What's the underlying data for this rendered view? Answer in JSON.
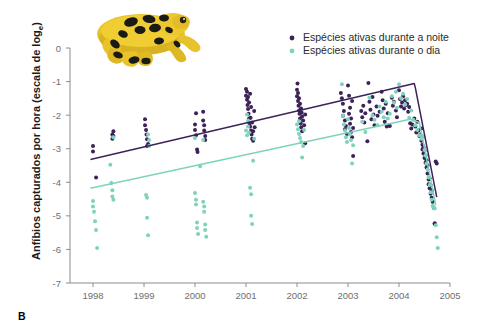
{
  "panel": {
    "letter": "B"
  },
  "axes": {
    "ylabel": "Anfíbios capturados por hora (escala de log",
    "ylabel_sub": "e",
    "ylabel_close": ")",
    "yticks": [
      "0",
      "-1",
      "-2",
      "-3",
      "-4",
      "-5",
      "-6",
      "-7"
    ],
    "xticks": [
      "1998",
      "1999",
      "2000",
      "2001",
      "2002",
      "2003",
      "2004",
      "2005"
    ]
  },
  "legend": {
    "items": [
      {
        "label": "Espécies ativas durante a noite",
        "color": "#3c2259",
        "key": "night"
      },
      {
        "label": "Espécies ativas durante o dia",
        "color": "#7fd3bb",
        "key": "day"
      }
    ]
  },
  "illustration": {
    "name": "harlequin-frog",
    "body_color": "#e8c32a",
    "spot_color": "#1c1a14",
    "shadow_color": "#b08c16"
  },
  "chart_data": {
    "type": "scatter",
    "title": "",
    "xlabel": "",
    "ylabel": "Anfíbios capturados por hora (escala de log_e)",
    "xlim": [
      1997.6,
      2005.3
    ],
    "ylim": [
      -7,
      0
    ],
    "grid": false,
    "legend_position": "top-right",
    "series": [
      {
        "name": "Espécies ativas durante a noite",
        "color": "#3c2259",
        "marker": "circle",
        "points": [
          [
            1998.0,
            -2.92
          ],
          [
            1998.0,
            -3.08
          ],
          [
            1998.06,
            -3.86
          ],
          [
            1998.38,
            -2.58
          ],
          [
            1998.38,
            -2.7
          ],
          [
            1998.4,
            -2.48
          ],
          [
            1998.4,
            -2.62
          ],
          [
            1999.02,
            -2.12
          ],
          [
            1999.02,
            -2.3
          ],
          [
            1999.04,
            -2.44
          ],
          [
            1999.05,
            -2.58
          ],
          [
            1999.06,
            -2.72
          ],
          [
            1999.06,
            -2.92
          ],
          [
            1999.08,
            -2.86
          ],
          [
            2000.0,
            -2.28
          ],
          [
            2000.0,
            -2.44
          ],
          [
            2000.02,
            -2.6
          ],
          [
            2000.02,
            -1.94
          ],
          [
            2000.04,
            -3.02
          ],
          [
            2000.05,
            -3.1
          ],
          [
            2000.16,
            -1.9
          ],
          [
            2000.16,
            -2.16
          ],
          [
            2000.18,
            -2.3
          ],
          [
            2000.18,
            -2.46
          ],
          [
            2000.2,
            -2.62
          ],
          [
            2000.2,
            -2.74
          ],
          [
            2001.0,
            -1.22
          ],
          [
            2001.0,
            -1.42
          ],
          [
            2001.02,
            -1.3
          ],
          [
            2001.02,
            -1.54
          ],
          [
            2001.03,
            -1.7
          ],
          [
            2001.04,
            -1.82
          ],
          [
            2001.04,
            -1.46
          ],
          [
            2001.05,
            -1.96
          ],
          [
            2001.06,
            -2.1
          ],
          [
            2001.06,
            -1.62
          ],
          [
            2001.07,
            -2.24
          ],
          [
            2001.08,
            -2.34
          ],
          [
            2001.08,
            -1.36
          ],
          [
            2001.09,
            -2.08
          ],
          [
            2001.1,
            -2.46
          ],
          [
            2001.1,
            -1.76
          ],
          [
            2001.11,
            -2.58
          ],
          [
            2001.12,
            -2.7
          ],
          [
            2001.12,
            -2.22
          ],
          [
            2001.14,
            -2.48
          ],
          [
            2001.14,
            -2.76
          ],
          [
            2001.16,
            -1.88
          ],
          [
            2001.17,
            -2.36
          ],
          [
            2002.0,
            -1.24
          ],
          [
            2002.0,
            -1.44
          ],
          [
            2002.01,
            -1.06
          ],
          [
            2002.02,
            -1.58
          ],
          [
            2002.02,
            -1.34
          ],
          [
            2002.03,
            -1.72
          ],
          [
            2002.04,
            -1.86
          ],
          [
            2002.04,
            -1.5
          ],
          [
            2002.05,
            -1.96
          ],
          [
            2002.06,
            -2.1
          ],
          [
            2002.06,
            -1.66
          ],
          [
            2002.07,
            -2.24
          ],
          [
            2002.08,
            -1.8
          ],
          [
            2002.08,
            -2.36
          ],
          [
            2002.09,
            -1.92
          ],
          [
            2002.1,
            -2.04
          ],
          [
            2002.1,
            -2.48
          ],
          [
            2002.12,
            -2.16
          ],
          [
            2002.14,
            -2.3
          ],
          [
            2002.16,
            -2.84
          ],
          [
            2002.16,
            -1.98
          ],
          [
            2002.86,
            -1.34
          ],
          [
            2002.88,
            -1.5
          ],
          [
            2002.9,
            -1.66
          ],
          [
            2002.9,
            -2.02
          ],
          [
            2002.92,
            -1.88
          ],
          [
            2002.94,
            -2.16
          ],
          [
            2002.94,
            -2.42
          ],
          [
            2002.96,
            -2.32
          ],
          [
            2002.98,
            -2.56
          ],
          [
            2003.0,
            -1.12
          ],
          [
            2003.02,
            -1.42
          ],
          [
            2003.02,
            -1.96
          ],
          [
            2003.04,
            -1.78
          ],
          [
            2003.04,
            -2.26
          ],
          [
            2003.06,
            -2.1
          ],
          [
            2003.06,
            -2.5
          ],
          [
            2003.08,
            -2.66
          ],
          [
            2003.08,
            -1.58
          ],
          [
            2003.1,
            -2.38
          ],
          [
            2003.1,
            -3.22
          ],
          [
            2003.26,
            -1.88
          ],
          [
            2003.28,
            -2.06
          ],
          [
            2003.3,
            -1.72
          ],
          [
            2003.32,
            -2.22
          ],
          [
            2003.34,
            -1.94
          ],
          [
            2003.38,
            -2.78
          ],
          [
            2003.4,
            -1.04
          ],
          [
            2003.42,
            -1.6
          ],
          [
            2003.44,
            -1.84
          ],
          [
            2003.46,
            -2.12
          ],
          [
            2003.48,
            -1.46
          ],
          [
            2003.5,
            -1.98
          ],
          [
            2003.52,
            -2.3
          ],
          [
            2003.56,
            -1.74
          ],
          [
            2003.58,
            -2.02
          ],
          [
            2003.62,
            -1.9
          ],
          [
            2003.66,
            -1.3
          ],
          [
            2003.68,
            -1.56
          ],
          [
            2003.7,
            -1.8
          ],
          [
            2003.72,
            -2.2
          ],
          [
            2003.74,
            -1.66
          ],
          [
            2003.76,
            -2.34
          ],
          [
            2003.78,
            -1.94
          ],
          [
            2003.8,
            -2.3
          ],
          [
            2003.82,
            -2.32
          ],
          [
            2003.86,
            -1.48
          ],
          [
            2003.88,
            -1.72
          ],
          [
            2003.9,
            -1.6
          ],
          [
            2003.94,
            -1.86
          ],
          [
            2003.96,
            -2.06
          ],
          [
            2004.0,
            -1.26
          ],
          [
            2004.02,
            -1.52
          ],
          [
            2004.04,
            -1.74
          ],
          [
            2004.06,
            -1.62
          ],
          [
            2004.08,
            -1.44
          ],
          [
            2004.1,
            -1.8
          ],
          [
            2004.12,
            -1.56
          ],
          [
            2004.14,
            -1.7
          ],
          [
            2004.16,
            -1.66
          ],
          [
            2004.18,
            -1.9
          ],
          [
            2004.2,
            -1.76
          ],
          [
            2004.22,
            -2.24
          ],
          [
            2004.24,
            -2.4
          ],
          [
            2004.26,
            -2.28
          ],
          [
            2004.3,
            -2.1
          ],
          [
            2004.32,
            -2.34
          ],
          [
            2004.34,
            -2.52
          ],
          [
            2004.36,
            -2.2
          ],
          [
            2004.38,
            -2.46
          ],
          [
            2004.4,
            -2.62
          ],
          [
            2004.42,
            -2.58
          ],
          [
            2004.44,
            -2.76
          ],
          [
            2004.44,
            -2.4
          ],
          [
            2004.46,
            -2.88
          ],
          [
            2004.46,
            -3.02
          ],
          [
            2004.48,
            -3.14
          ],
          [
            2004.48,
            -2.96
          ],
          [
            2004.5,
            -3.28
          ],
          [
            2004.5,
            -3.06
          ],
          [
            2004.52,
            -3.42
          ],
          [
            2004.52,
            -3.2
          ],
          [
            2004.54,
            -3.56
          ],
          [
            2004.54,
            -3.34
          ],
          [
            2004.56,
            -3.74
          ],
          [
            2004.56,
            -3.5
          ],
          [
            2004.58,
            -3.92
          ],
          [
            2004.58,
            -4.06
          ],
          [
            2004.6,
            -4.18
          ],
          [
            2004.6,
            -3.88
          ],
          [
            2004.62,
            -4.34
          ],
          [
            2004.62,
            -4.08
          ],
          [
            2004.64,
            -4.46
          ],
          [
            2004.64,
            -4.24
          ],
          [
            2004.66,
            -4.58
          ],
          [
            2004.68,
            -4.76
          ],
          [
            2004.7,
            -5.22
          ],
          [
            2004.7,
            -5.24
          ],
          [
            2004.72,
            -3.38
          ],
          [
            2004.74,
            -3.44
          ]
        ]
      },
      {
        "name": "Espécies ativas durante o dia",
        "color": "#7fd3bb",
        "marker": "circle",
        "points": [
          [
            1998.0,
            -4.56
          ],
          [
            1998.0,
            -4.72
          ],
          [
            1998.02,
            -4.88
          ],
          [
            1998.04,
            -5.16
          ],
          [
            1998.06,
            -5.42
          ],
          [
            1998.08,
            -5.96
          ],
          [
            1998.34,
            -3.48
          ],
          [
            1998.36,
            -4.02
          ],
          [
            1998.38,
            -4.24
          ],
          [
            1998.38,
            -4.42
          ],
          [
            1998.4,
            -4.52
          ],
          [
            1998.4,
            -2.66
          ],
          [
            1999.04,
            -4.38
          ],
          [
            1999.06,
            -4.46
          ],
          [
            1999.06,
            -5.06
          ],
          [
            1999.08,
            -5.58
          ],
          [
            1999.08,
            -2.58
          ],
          [
            1999.1,
            -2.74
          ],
          [
            1999.1,
            -2.92
          ],
          [
            2000.0,
            -2.68
          ],
          [
            2000.0,
            -4.32
          ],
          [
            2000.02,
            -4.52
          ],
          [
            2000.02,
            -4.66
          ],
          [
            2000.04,
            -5.2
          ],
          [
            2000.04,
            -5.36
          ],
          [
            2000.06,
            -5.54
          ],
          [
            2000.16,
            -2.74
          ],
          [
            2000.16,
            -4.58
          ],
          [
            2000.18,
            -4.72
          ],
          [
            2000.18,
            -4.88
          ],
          [
            2000.2,
            -5.26
          ],
          [
            2000.2,
            -5.42
          ],
          [
            2000.22,
            -5.62
          ],
          [
            2000.1,
            -3.52
          ],
          [
            2001.0,
            -2.46
          ],
          [
            2001.02,
            -2.6
          ],
          [
            2001.02,
            -1.98
          ],
          [
            2001.04,
            -2.16
          ],
          [
            2001.04,
            -2.34
          ],
          [
            2001.06,
            -2.52
          ],
          [
            2001.08,
            -4.16
          ],
          [
            2001.1,
            -4.36
          ],
          [
            2001.1,
            -5.0
          ],
          [
            2001.12,
            -5.24
          ],
          [
            2001.14,
            -3.36
          ],
          [
            2001.16,
            -2.7
          ],
          [
            2002.0,
            -2.28
          ],
          [
            2002.02,
            -2.42
          ],
          [
            2002.04,
            -2.56
          ],
          [
            2002.04,
            -2.18
          ],
          [
            2002.06,
            -2.68
          ],
          [
            2002.08,
            -2.8
          ],
          [
            2002.1,
            -3.26
          ],
          [
            2002.12,
            -2.92
          ],
          [
            2002.14,
            -2.44
          ],
          [
            2002.88,
            -1.08
          ],
          [
            2002.9,
            -2.02
          ],
          [
            2002.92,
            -2.28
          ],
          [
            2002.94,
            -2.46
          ],
          [
            2002.96,
            -2.66
          ],
          [
            2002.98,
            -2.8
          ],
          [
            2003.0,
            -2.12
          ],
          [
            2003.02,
            -2.38
          ],
          [
            2003.04,
            -2.58
          ],
          [
            2003.06,
            -2.74
          ],
          [
            2003.08,
            -3.44
          ],
          [
            2003.1,
            -2.9
          ],
          [
            2003.28,
            -2.2
          ],
          [
            2003.34,
            -2.5
          ],
          [
            2003.42,
            -1.48
          ],
          [
            2003.48,
            -2.0
          ],
          [
            2003.52,
            -2.14
          ],
          [
            2003.58,
            -2.3
          ],
          [
            2003.62,
            -1.74
          ],
          [
            2003.66,
            -1.9
          ],
          [
            2003.7,
            -2.06
          ],
          [
            2003.74,
            -1.6
          ],
          [
            2003.78,
            -2.1
          ],
          [
            2003.82,
            -1.96
          ],
          [
            2003.86,
            -1.44
          ],
          [
            2003.9,
            -1.62
          ],
          [
            2003.94,
            -1.3
          ],
          [
            2003.96,
            -1.78
          ],
          [
            2004.0,
            -1.08
          ],
          [
            2004.04,
            -1.5
          ],
          [
            2004.08,
            -1.36
          ],
          [
            2004.12,
            -1.68
          ],
          [
            2004.16,
            -1.52
          ],
          [
            2004.2,
            -2.08
          ],
          [
            2004.24,
            -1.86
          ],
          [
            2004.28,
            -2.14
          ],
          [
            2004.32,
            -2.3
          ],
          [
            2004.36,
            -2.44
          ],
          [
            2004.4,
            -2.6
          ],
          [
            2004.44,
            -2.7
          ],
          [
            2004.48,
            -2.64
          ],
          [
            2004.5,
            -3.04
          ],
          [
            2004.52,
            -3.2
          ],
          [
            2004.54,
            -3.44
          ],
          [
            2004.56,
            -3.62
          ],
          [
            2004.58,
            -3.86
          ],
          [
            2004.6,
            -4.08
          ],
          [
            2004.62,
            -4.3
          ],
          [
            2004.64,
            -4.52
          ],
          [
            2004.66,
            -4.7
          ],
          [
            2004.68,
            -4.74
          ],
          [
            2004.7,
            -4.78
          ],
          [
            2004.72,
            -5.28
          ],
          [
            2004.74,
            -5.64
          ],
          [
            2004.76,
            -5.96
          ]
        ]
      }
    ],
    "trend_lines": [
      {
        "name": "night-trend",
        "color": "#3c2259",
        "vertices": [
          [
            1997.95,
            -3.32
          ],
          [
            2004.3,
            -1.06
          ],
          [
            2004.32,
            -1.18
          ],
          [
            2004.74,
            -4.44
          ]
        ]
      },
      {
        "name": "day-trend",
        "color": "#7fd3bb",
        "vertices": [
          [
            1997.95,
            -4.18
          ],
          [
            2004.22,
            -2.12
          ],
          [
            2004.4,
            -2.22
          ],
          [
            2004.72,
            -4.68
          ]
        ]
      }
    ]
  }
}
